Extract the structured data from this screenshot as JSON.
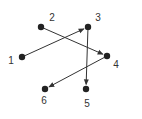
{
  "diagram": {
    "title": "",
    "colors": {
      "line": "#333333",
      "point": "#222222",
      "label": "#333333",
      "background": "#ffffff"
    },
    "nodes": [
      {
        "id": "1",
        "label": "1",
        "x": 22,
        "y": 57,
        "label_x": 11,
        "label_y": 64
      },
      {
        "id": "2",
        "label": "2",
        "x": 41,
        "y": 27,
        "label_x": 52,
        "label_y": 21
      },
      {
        "id": "3",
        "label": "3",
        "x": 88,
        "y": 27,
        "label_x": 98,
        "label_y": 21
      },
      {
        "id": "4",
        "label": "4",
        "x": 107,
        "y": 56,
        "label_x": 116,
        "label_y": 68
      },
      {
        "id": "5",
        "label": "5",
        "x": 86,
        "y": 89,
        "label_x": 87,
        "label_y": 107
      },
      {
        "id": "6",
        "label": "6",
        "x": 45,
        "y": 89,
        "label_x": 44,
        "label_y": 104
      }
    ],
    "edges": [
      {
        "from": "1",
        "to": "3",
        "directed": true
      },
      {
        "from": "2",
        "to": "4",
        "directed": true
      },
      {
        "from": "3",
        "to": "5",
        "directed": true
      },
      {
        "from": "4",
        "to": "6",
        "directed": true
      }
    ]
  }
}
